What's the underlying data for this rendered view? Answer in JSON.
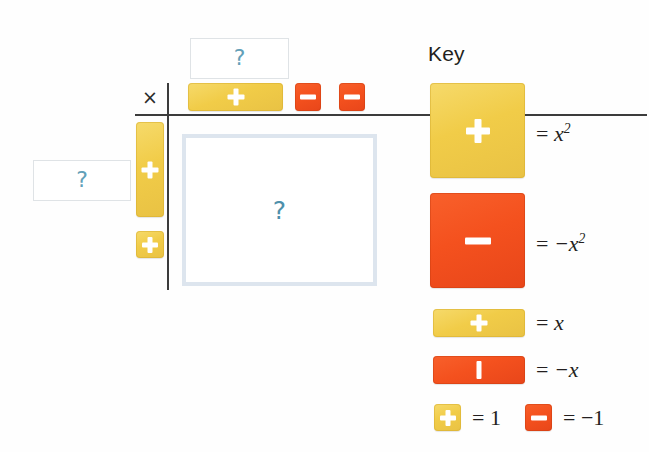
{
  "canvas": {
    "width": 649,
    "height": 452,
    "background": "#ffffff"
  },
  "colors": {
    "tile_yellow": "#F1CC48",
    "tile_red": "#F4511E",
    "question_blue": "#63A0B8",
    "answer_border": "#DDE5EE",
    "rule_black": "#3C3C3C",
    "text": "#231F20"
  },
  "mat": {
    "operator_symbol": "×",
    "top_question": {
      "mark": "?"
    },
    "left_question": {
      "mark": "?"
    },
    "product_region": {
      "mark": "?"
    },
    "top_factor_tiles": [
      {
        "type": "x-tile",
        "sign": "plus",
        "color": "yellow",
        "glyph": "+"
      },
      {
        "type": "unit-tile",
        "sign": "minus",
        "color": "red",
        "glyph": "−"
      },
      {
        "type": "unit-tile",
        "sign": "minus",
        "color": "red",
        "glyph": "−"
      }
    ],
    "left_factor_tiles": [
      {
        "type": "x-tile",
        "sign": "plus",
        "color": "yellow",
        "glyph": "+"
      },
      {
        "type": "unit-tile",
        "sign": "plus",
        "color": "yellow",
        "glyph": "+"
      }
    ]
  },
  "key": {
    "title": "Key",
    "entries": [
      {
        "id": "x-squared-positive",
        "tile": "large-square",
        "color": "yellow",
        "glyph": "plus",
        "equals": "=",
        "value": "x²",
        "value_base": "x",
        "value_exp": "2",
        "value_negative": false
      },
      {
        "id": "x-squared-negative",
        "tile": "large-square",
        "color": "red",
        "glyph": "minus",
        "equals": "=",
        "value": "−x²",
        "value_base": "x",
        "value_exp": "2",
        "value_negative": true
      },
      {
        "id": "x-positive",
        "tile": "rectangle",
        "color": "yellow",
        "glyph": "plus",
        "equals": "=",
        "value": "x",
        "value_base": "x",
        "value_exp": "",
        "value_negative": false
      },
      {
        "id": "x-negative",
        "tile": "rectangle",
        "color": "red",
        "glyph": "bar",
        "equals": "=",
        "value": "−x",
        "value_base": "x",
        "value_exp": "",
        "value_negative": true
      },
      {
        "id": "one-positive",
        "tile": "small-square",
        "color": "yellow",
        "glyph": "plus",
        "equals": "=",
        "value": "1",
        "value_base": "1",
        "value_exp": "",
        "value_negative": false
      },
      {
        "id": "one-negative",
        "tile": "small-square",
        "color": "red",
        "glyph": "minus",
        "equals": "=",
        "value": "−1",
        "value_base": "1",
        "value_exp": "",
        "value_negative": true
      }
    ]
  }
}
